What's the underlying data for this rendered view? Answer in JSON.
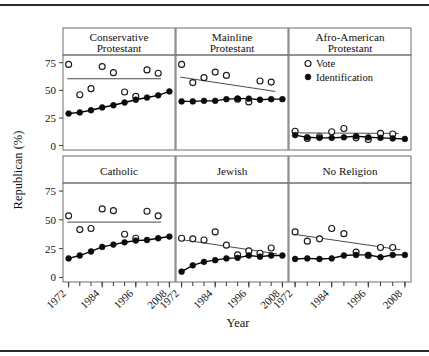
{
  "figure": {
    "ylabel": "Republican (%)",
    "xlabel": "Year",
    "y_ticks": [
      "75",
      "50",
      "25",
      "0"
    ],
    "y_tick_values": [
      75,
      50,
      25,
      0
    ],
    "x_ticks": [
      "1972",
      "1984",
      "1996",
      "2008"
    ],
    "x_tick_values": [
      1972,
      1984,
      1996,
      2008
    ],
    "ylim": [
      -4,
      82
    ],
    "xlim": [
      1970,
      2010
    ],
    "grid": false,
    "top_rule": true,
    "bottom_rule": true
  },
  "legend": {
    "position": "top-right-panel",
    "entries": [
      {
        "label": "Vote",
        "marker": "open-circle"
      },
      {
        "label": "Identification",
        "marker": "filled-circle"
      }
    ]
  },
  "colors": {
    "point_fill": "#0c0c0c",
    "point_open": "#ffffff",
    "point_stroke": "#1a1a1a",
    "trend": "#4a4a4a",
    "frame": "#6e6e6e",
    "rule": "#2b2b2b",
    "background": "#ffffff"
  },
  "chart_data": {
    "type": "scatter",
    "title": "",
    "xlabel": "Year",
    "ylabel": "Republican (%)",
    "xlim": [
      1970,
      2010
    ],
    "ylim": [
      -4,
      82
    ],
    "grid": false,
    "legend": [
      "Vote",
      "Identification"
    ],
    "legend_position": "top-right-panel",
    "layout": {
      "rows": 2,
      "cols": 3,
      "strip_labels_top": true
    },
    "panels": [
      {
        "name": "Conservative Protestant",
        "row": 0,
        "col": 0,
        "x": [
          1972,
          1976,
          1980,
          1984,
          1988,
          1992,
          1996,
          2000,
          2004,
          2008
        ],
        "series": [
          {
            "name": "Vote",
            "marker": "open-circle",
            "values": [
              73.5,
              46.0,
              51.5,
              71.5,
              66.0,
              48.5,
              44.5,
              68.5,
              65.5,
              null
            ],
            "trend": {
              "y_start": 60.5,
              "y_end": 60.5,
              "x_start": 1971.5,
              "x_end": 2005.0
            }
          },
          {
            "name": "Identification",
            "marker": "filled-circle",
            "connected": true,
            "values": [
              29.0,
              30.0,
              32.0,
              34.5,
              36.5,
              39.0,
              41.5,
              43.5,
              45.5,
              49.0
            ],
            "trend": null
          }
        ]
      },
      {
        "name": "Mainline Protestant",
        "row": 0,
        "col": 1,
        "x": [
          1972,
          1976,
          1980,
          1984,
          1988,
          1992,
          1996,
          2000,
          2004,
          2008
        ],
        "series": [
          {
            "name": "Vote",
            "marker": "open-circle",
            "values": [
              73.5,
              57.0,
              61.5,
              66.5,
              63.5,
              42.0,
              39.5,
              58.5,
              57.5,
              null
            ],
            "trend": {
              "y_start": 62.0,
              "y_end": 49.0,
              "x_start": 1971.5,
              "x_end": 2005.5
            }
          },
          {
            "name": "Identification",
            "marker": "filled-circle",
            "connected": true,
            "values": [
              40.0,
              40.0,
              40.5,
              40.5,
              42.0,
              42.5,
              42.5,
              41.5,
              42.0,
              42.0
            ],
            "trend": null
          }
        ]
      },
      {
        "name": "Afro-American Protestant",
        "row": 0,
        "col": 2,
        "x": [
          1972,
          1976,
          1980,
          1984,
          1988,
          1992,
          1996,
          2000,
          2004,
          2008
        ],
        "series": [
          {
            "name": "Vote",
            "marker": "open-circle",
            "values": [
              13.0,
              6.5,
              8.0,
              12.5,
              15.5,
              7.0,
              5.5,
              11.0,
              10.5,
              null
            ],
            "trend": {
              "y_start": 11.5,
              "y_end": 11.0,
              "x_start": 1971.5,
              "x_end": 2006.0
            }
          },
          {
            "name": "Identification",
            "marker": "filled-circle",
            "connected": true,
            "values": [
              9.5,
              7.5,
              7.0,
              7.0,
              7.5,
              8.5,
              7.5,
              7.0,
              6.5,
              6.0
            ],
            "trend": null
          }
        ]
      },
      {
        "name": "Catholic",
        "row": 1,
        "col": 0,
        "x": [
          1972,
          1976,
          1980,
          1984,
          1988,
          1992,
          1996,
          2000,
          2004,
          2008
        ],
        "series": [
          {
            "name": "Vote",
            "marker": "open-circle",
            "values": [
              53.5,
              41.5,
              42.5,
              59.5,
              58.0,
              37.5,
              34.0,
              57.5,
              53.5,
              null
            ],
            "trend": {
              "y_start": 48.0,
              "y_end": 48.0,
              "x_start": 1971.5,
              "x_end": 2005.0
            }
          },
          {
            "name": "Identification",
            "marker": "filled-circle",
            "connected": true,
            "values": [
              16.5,
              19.0,
              22.5,
              26.5,
              28.5,
              30.5,
              32.0,
              32.5,
              34.0,
              35.5
            ],
            "trend": null
          }
        ]
      },
      {
        "name": "Jewish",
        "row": 1,
        "col": 1,
        "x": [
          1972,
          1976,
          1980,
          1984,
          1988,
          1992,
          1996,
          2000,
          2004,
          2008
        ],
        "series": [
          {
            "name": "Vote",
            "marker": "open-circle",
            "values": [
              34.0,
              33.5,
              32.5,
              39.5,
              28.0,
              19.5,
              23.0,
              21.0,
              25.5,
              null
            ],
            "trend": {
              "y_start": 33.0,
              "y_end": 20.5,
              "x_start": 1971.5,
              "x_end": 2006.0
            }
          },
          {
            "name": "Identification",
            "marker": "filled-circle",
            "connected": true,
            "values": [
              5.0,
              10.5,
              13.5,
              15.0,
              16.5,
              17.0,
              19.0,
              18.0,
              19.0,
              19.0
            ],
            "trend": null
          }
        ]
      },
      {
        "name": "No Religion",
        "row": 1,
        "col": 2,
        "x": [
          1972,
          1976,
          1980,
          1984,
          1988,
          1992,
          1996,
          2000,
          2004,
          2008
        ],
        "series": [
          {
            "name": "Vote",
            "marker": "open-circle",
            "values": [
              39.5,
              31.5,
              33.5,
              42.5,
              38.0,
              22.0,
              19.0,
              26.0,
              26.0,
              null
            ],
            "trend": {
              "y_start": 37.5,
              "y_end": 24.0,
              "x_start": 1971.5,
              "x_end": 2006.5
            }
          },
          {
            "name": "Identification",
            "marker": "filled-circle",
            "connected": true,
            "values": [
              16.0,
              16.5,
              16.0,
              16.5,
              19.0,
              19.5,
              19.5,
              17.5,
              19.5,
              19.5
            ],
            "trend": null
          }
        ]
      }
    ]
  }
}
